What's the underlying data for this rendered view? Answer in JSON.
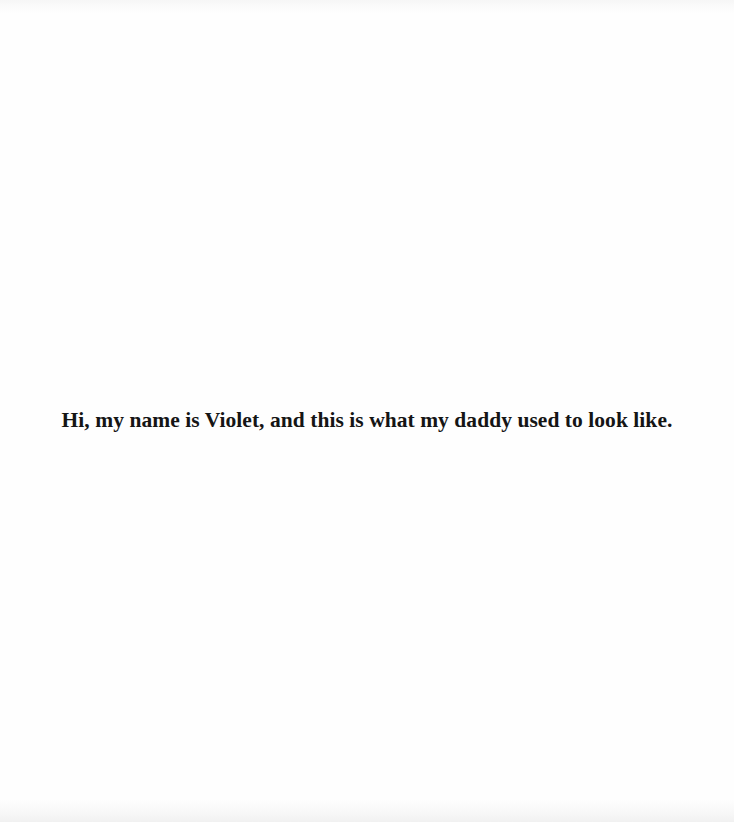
{
  "page": {
    "caption": "Hi, my name is Violet, and this is what my daddy used to look like."
  }
}
